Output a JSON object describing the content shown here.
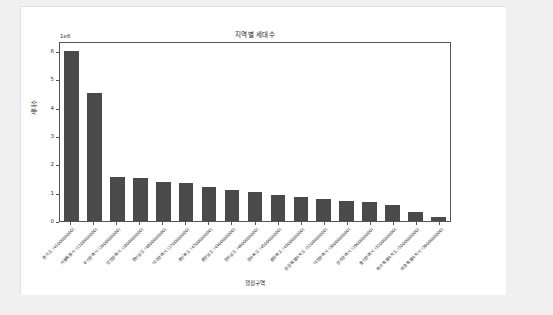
{
  "chart_data": {
    "type": "bar",
    "title": "지역별 세대수",
    "xlabel": "행정구역",
    "ylabel": "세대수",
    "y_offset_text": "1e6",
    "grid": false,
    "legend": false,
    "ylim": [
      0,
      6.35
    ],
    "y_ticks": [
      "0",
      "1",
      "2",
      "3",
      "4",
      "5",
      "6"
    ],
    "y_tick_values": [
      0,
      1,
      2,
      3,
      4,
      5,
      6
    ],
    "categories": [
      "경기도  (4100000000)",
      "서울특별시  (1100000000)",
      "부산광역시  (2600000000)",
      "인천광역시  (2800000000)",
      "경상남도  (4800000000)",
      "대구광역시  (2700000000)",
      "경상북도  (4700000000)",
      "충청남도  (4400000000)",
      "전라남도  (4600000000)",
      "전라북도  (4500000000)",
      "충청북도  (4300000000)",
      "강원특별자치도  (5100000000)",
      "대전광역시  (3000000000)",
      "광주광역시  (2900000000)",
      "울산광역시  (3100000000)",
      "제주특별자치도  (5000000000)",
      "세종특별자치시  (3600000000)"
    ],
    "values": [
      6.0,
      4.5,
      1.55,
      1.5,
      1.38,
      1.33,
      1.2,
      1.1,
      1.02,
      0.93,
      0.85,
      0.78,
      0.72,
      0.68,
      0.56,
      0.32,
      0.15
    ],
    "value_unit": "1e6 세대",
    "bar_color": "#4a4a4a",
    "background_color": "#ffffff",
    "axis_color": "#555555"
  }
}
